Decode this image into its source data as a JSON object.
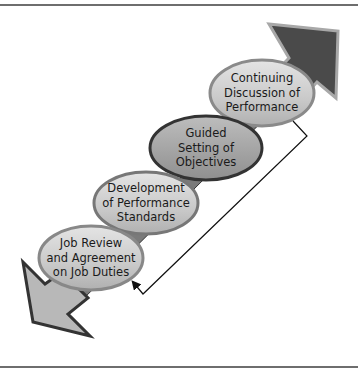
{
  "diagram": {
    "type": "process-arrow",
    "direction": "bottom-left to top-right, double-headed",
    "steps": [
      {
        "label": "Job Review\nand Agreement\non Job Duties"
      },
      {
        "label": "Development\nof Performance\nStandards"
      },
      {
        "label": "Guided\nSetting of\nObjectives"
      },
      {
        "label": "Continuing\nDiscussion of\nPerformance"
      }
    ],
    "feedback_loop": {
      "from": "Continuing Discussion of Performance",
      "to": "Job Review and Agreement on Job Duties"
    },
    "colors": {
      "arrow_dark": "#4a4a4a",
      "arrow_light": "#b8b8b8",
      "oval_fill": "#cfcfcf",
      "oval_fill_dark": "#a8a8a8",
      "outline": "#333333",
      "connector": "#111111"
    }
  }
}
